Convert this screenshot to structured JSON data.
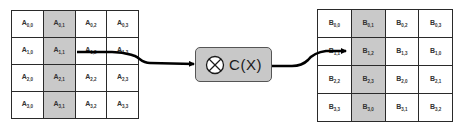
{
  "diagram": {
    "matrix_a": {
      "symbol": "A",
      "highlighted_column": 1,
      "rows": [
        [
          {
            "r": "0",
            "c": "0"
          },
          {
            "r": "0",
            "c": "1"
          },
          {
            "r": "0",
            "c": "2"
          },
          {
            "r": "0",
            "c": "3"
          }
        ],
        [
          {
            "r": "1",
            "c": "0"
          },
          {
            "r": "1",
            "c": "1"
          },
          {
            "r": "1",
            "c": "2"
          },
          {
            "r": "1",
            "c": "3"
          }
        ],
        [
          {
            "r": "2",
            "c": "0"
          },
          {
            "r": "2",
            "c": "1"
          },
          {
            "r": "2",
            "c": "2"
          },
          {
            "r": "2",
            "c": "3"
          }
        ],
        [
          {
            "r": "3",
            "c": "0"
          },
          {
            "r": "3",
            "c": "1"
          },
          {
            "r": "3",
            "c": "2"
          },
          {
            "r": "3",
            "c": "3"
          }
        ]
      ]
    },
    "operation": {
      "label": "C(X)",
      "icon": "circled-times-icon",
      "fill_color": "#c8c8c8"
    },
    "matrix_b": {
      "symbol": "B",
      "highlighted_column": 1,
      "rows": [
        [
          {
            "r": "0",
            "c": "0"
          },
          {
            "r": "0",
            "c": "1"
          },
          {
            "r": "0",
            "c": "2"
          },
          {
            "r": "0",
            "c": "3"
          }
        ],
        [
          {
            "r": "1",
            "c": "1"
          },
          {
            "r": "1",
            "c": "2"
          },
          {
            "r": "1",
            "c": "3"
          },
          {
            "r": "1",
            "c": "0"
          }
        ],
        [
          {
            "r": "2",
            "c": "2"
          },
          {
            "r": "2",
            "c": "3"
          },
          {
            "r": "2",
            "c": "0"
          },
          {
            "r": "2",
            "c": "1"
          }
        ],
        [
          {
            "r": "3",
            "c": "3"
          },
          {
            "r": "3",
            "c": "0"
          },
          {
            "r": "3",
            "c": "1"
          },
          {
            "r": "3",
            "c": "2"
          }
        ]
      ]
    },
    "colors": {
      "shaded_column": "#c9c9c9",
      "grid_line": "#2a2a2a",
      "arrow": "#000000"
    }
  }
}
